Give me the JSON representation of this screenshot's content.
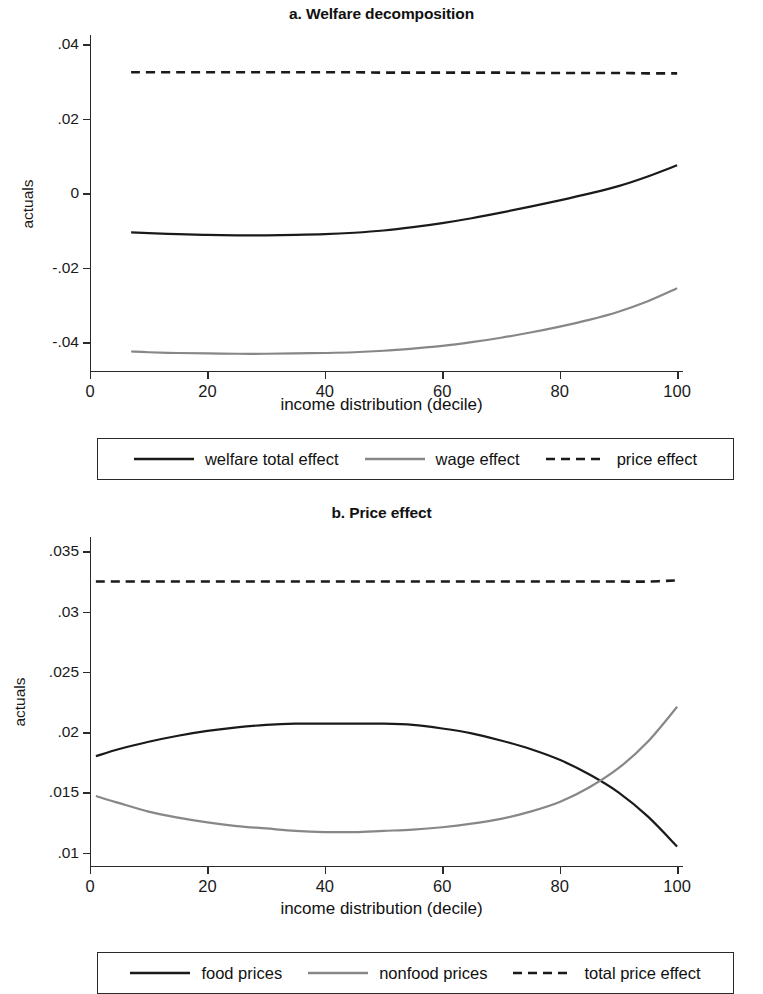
{
  "figure": {
    "panels": [
      {
        "id": "a",
        "title": "a. Welfare decomposition",
        "ylabel": "actuals",
        "xlabel": "income distribution (decile)"
      },
      {
        "id": "b",
        "title": "b. Price effect",
        "ylabel": "actuals",
        "xlabel": "income distribution (decile)"
      }
    ]
  },
  "colors": {
    "black_line": "#1a1a1a",
    "gray_line": "#878787",
    "axis": "#2b2b2b",
    "background": "#ffffff"
  },
  "legend_a": {
    "items": [
      {
        "label": "welfare total effect",
        "style": "solid",
        "color": "#1a1a1a"
      },
      {
        "label": "wage effect",
        "style": "solid",
        "color": "#878787"
      },
      {
        "label": "price effect",
        "style": "dashed",
        "color": "#1a1a1a"
      }
    ]
  },
  "legend_b": {
    "items": [
      {
        "label": "food prices",
        "style": "solid",
        "color": "#1a1a1a"
      },
      {
        "label": "nonfood prices",
        "style": "solid",
        "color": "#878787"
      },
      {
        "label": "total price effect",
        "style": "dashed",
        "color": "#1a1a1a"
      }
    ]
  },
  "chart_data": [
    {
      "type": "line",
      "title": "a. Welfare decomposition",
      "xlabel": "income distribution (decile)",
      "ylabel": "actuals",
      "xlim": [
        0,
        101
      ],
      "ylim": [
        -0.048,
        0.0425
      ],
      "grid": false,
      "legend_position": "below",
      "xticks": [
        0,
        20,
        40,
        60,
        80,
        100
      ],
      "xticklabels": [
        "0",
        "20",
        "40",
        "60",
        "80",
        "100"
      ],
      "yticks": [
        0.04,
        0.02,
        0,
        -0.02,
        -0.04
      ],
      "yticklabels": [
        ".04",
        ".02",
        "0",
        "-.02",
        "-.04"
      ],
      "x": [
        7,
        10,
        15,
        20,
        25,
        30,
        35,
        40,
        45,
        50,
        55,
        60,
        65,
        70,
        75,
        80,
        85,
        90,
        95,
        100
      ],
      "series": [
        {
          "name": "welfare total effect",
          "style": "solid",
          "color": "#1a1a1a",
          "values": [
            -0.0105,
            -0.0107,
            -0.011,
            -0.0112,
            -0.0113,
            -0.0113,
            -0.0112,
            -0.011,
            -0.0106,
            -0.01,
            -0.0091,
            -0.008,
            -0.0067,
            -0.0052,
            -0.0036,
            -0.0019,
            -0.0001,
            0.0019,
            0.0045,
            0.0075
          ]
        },
        {
          "name": "wage effect",
          "style": "solid",
          "color": "#878787",
          "values": [
            -0.0425,
            -0.0427,
            -0.0429,
            -0.043,
            -0.0431,
            -0.0431,
            -0.043,
            -0.0429,
            -0.0427,
            -0.0423,
            -0.0417,
            -0.041,
            -0.04,
            -0.0388,
            -0.0374,
            -0.0358,
            -0.034,
            -0.0318,
            -0.029,
            -0.0255
          ]
        },
        {
          "name": "price effect",
          "style": "dashed",
          "color": "#1a1a1a",
          "values": [
            0.0325,
            0.0325,
            0.0325,
            0.0325,
            0.0325,
            0.0325,
            0.0325,
            0.0325,
            0.0325,
            0.0324,
            0.0324,
            0.0324,
            0.0324,
            0.0324,
            0.0323,
            0.0323,
            0.0323,
            0.0323,
            0.0322,
            0.0322
          ]
        }
      ]
    },
    {
      "type": "line",
      "title": "b. Price effect",
      "xlabel": "income distribution (decile)",
      "ylabel": "actuals",
      "xlim": [
        0,
        101
      ],
      "ylim": [
        0.0088,
        0.0362
      ],
      "grid": false,
      "legend_position": "below",
      "xticks": [
        0,
        20,
        40,
        60,
        80,
        100
      ],
      "xticklabels": [
        "0",
        "20",
        "40",
        "60",
        "80",
        "100"
      ],
      "yticks": [
        0.035,
        0.03,
        0.025,
        0.02,
        0.015,
        0.01
      ],
      "yticklabels": [
        ".035",
        ".03",
        ".025",
        ".02",
        ".015",
        ".01"
      ],
      "x": [
        1,
        5,
        10,
        15,
        20,
        25,
        30,
        35,
        40,
        45,
        50,
        55,
        60,
        65,
        70,
        75,
        80,
        85,
        90,
        95,
        100
      ],
      "series": [
        {
          "name": "food prices",
          "style": "solid",
          "color": "#1a1a1a",
          "values": [
            0.018,
            0.0186,
            0.0192,
            0.0197,
            0.0201,
            0.0204,
            0.0206,
            0.0207,
            0.0207,
            0.0207,
            0.0207,
            0.0206,
            0.0203,
            0.0199,
            0.0193,
            0.0186,
            0.0177,
            0.0165,
            0.015,
            0.013,
            0.0105
          ]
        },
        {
          "name": "nonfood prices",
          "style": "solid",
          "color": "#878787",
          "values": [
            0.0147,
            0.0141,
            0.0134,
            0.0129,
            0.0125,
            0.0122,
            0.012,
            0.0118,
            0.0117,
            0.0117,
            0.0118,
            0.0119,
            0.0121,
            0.0124,
            0.0128,
            0.0134,
            0.0142,
            0.0154,
            0.017,
            0.0192,
            0.0221
          ]
        },
        {
          "name": "total price effect",
          "style": "dashed",
          "color": "#1a1a1a",
          "values": [
            0.0325,
            0.0325,
            0.0325,
            0.0325,
            0.0325,
            0.0325,
            0.0325,
            0.0325,
            0.0325,
            0.0325,
            0.0325,
            0.0325,
            0.0325,
            0.0325,
            0.0325,
            0.0325,
            0.0325,
            0.0325,
            0.0325,
            0.0325,
            0.0326
          ]
        }
      ]
    }
  ]
}
